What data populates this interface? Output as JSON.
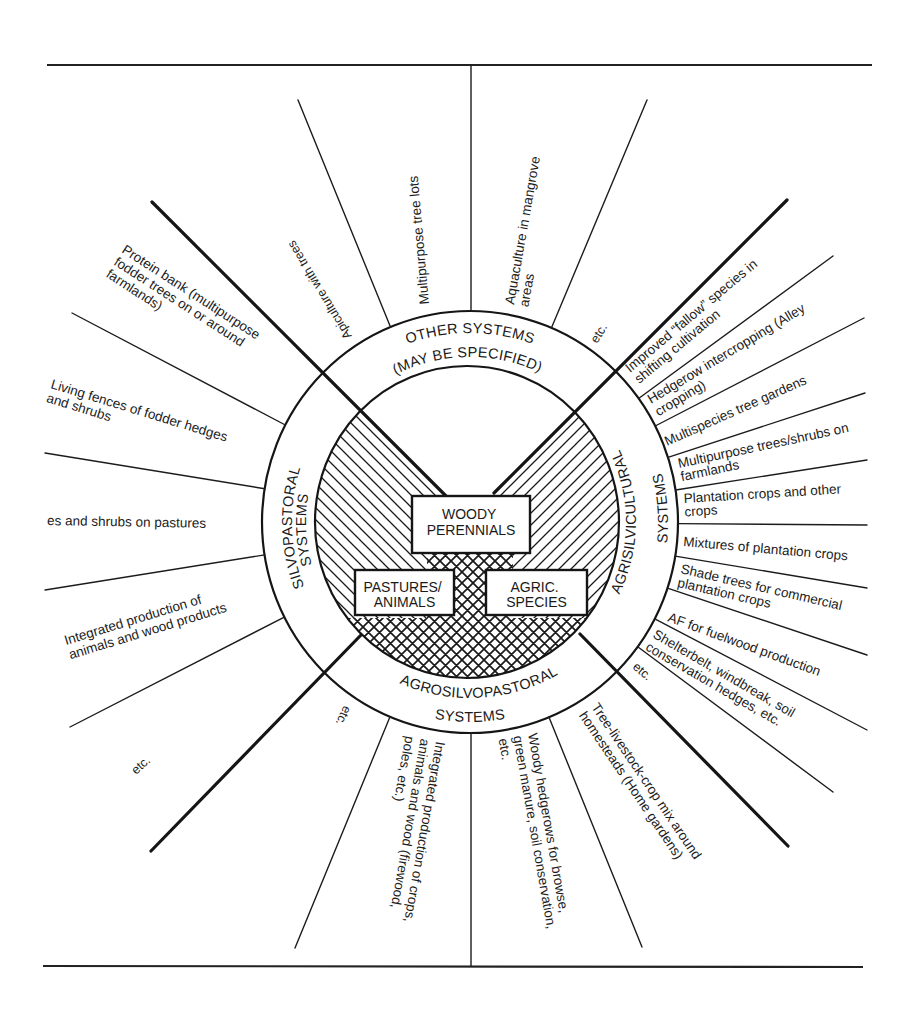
{
  "figure": {
    "center": {
      "woody_perennials": {
        "line1": "WOODY",
        "line2": "PERENNIALS"
      },
      "pastures_animals": {
        "line1": "PASTURES/",
        "line2": "ANIMALS"
      },
      "agric_species": {
        "line1": "AGRIC.",
        "line2": "SPECIES"
      }
    },
    "ring": {
      "other_systems": {
        "line1": "OTHER SYSTEMS",
        "line2": "(MAY BE SPECIFIED)"
      },
      "silvopastoral": {
        "line1": "SILVOPASTORAL",
        "line2": "SYSTEMS"
      },
      "agrisilvicultural": {
        "line1": "AGRISILVICULTURAL",
        "line2": "SYSTEMS"
      },
      "agrosilvopastoral": {
        "line1": "AGROSILVOPASTORAL",
        "line2": "SYSTEMS"
      }
    },
    "practices": {
      "other_systems": [
        {
          "lines": [
            "Apiculture with trees"
          ]
        },
        {
          "lines": [
            "Multipurpose tree lots"
          ]
        },
        {
          "lines": [
            "Aquaculture in mangrove",
            "areas"
          ]
        },
        {
          "lines": [
            "etc."
          ]
        }
      ],
      "silvopastoral": [
        {
          "lines": [
            "Protein bank (multipurpose",
            "fodder trees on or around",
            "farmlands)"
          ]
        },
        {
          "lines": [
            "Living fences of fodder hedges",
            "and shrubs"
          ]
        },
        {
          "lines": [
            "es and shrubs on pastures"
          ]
        },
        {
          "lines": [
            "Integrated production of",
            "animals and wood products"
          ]
        },
        {
          "lines": [
            "etc."
          ]
        }
      ],
      "agrosilvopastoral": [
        {
          "lines": [
            "etc."
          ]
        },
        {
          "lines": [
            "Integrated production of crops,",
            "animals and wood (firewood,",
            "poles, etc.)"
          ]
        },
        {
          "lines": [
            "Woody hedgerows for browse,",
            "green manure, soil conservation,",
            "etc."
          ]
        },
        {
          "lines": [
            "Tree-livestock-crop mix around",
            "homesteads (Home gardens)"
          ]
        }
      ],
      "agrisilvicultural": [
        {
          "lines": [
            "Improved “fallow” species in",
            "shifting cultivation"
          ]
        },
        {
          "lines": [
            "Hedgerow intercropping (Alley",
            "cropping)"
          ]
        },
        {
          "lines": [
            "Multispecies tree gardens"
          ]
        },
        {
          "lines": [
            "Multipurpose trees/shrubs on",
            "farmlands"
          ]
        },
        {
          "lines": [
            "Plantation crops and other",
            "crops"
          ]
        },
        {
          "lines": [
            "Mixtures of plantation crops"
          ]
        },
        {
          "lines": [
            "Shade trees for commercial",
            "plantation crops"
          ]
        },
        {
          "lines": [
            "AF for fuelwood production"
          ]
        },
        {
          "lines": [
            "Shelterbelt, windbreak, soil",
            "conservation hedges, etc."
          ]
        },
        {
          "lines": [
            "etc."
          ]
        }
      ]
    }
  }
}
